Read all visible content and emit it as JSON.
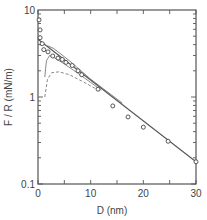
{
  "chart_data": {
    "type": "scatter",
    "title": "",
    "xlabel": "D  (nm)",
    "ylabel": "F / R  (mN/m)",
    "xlim": [
      0,
      30
    ],
    "ylim": [
      0.1,
      10
    ],
    "yscale": "log",
    "grid": false,
    "x_ticks": [
      0,
      10,
      20,
      30
    ],
    "x_tick_labels": [
      "0",
      "10",
      "20",
      "30"
    ],
    "x_minor_ticks": [
      5,
      15,
      25
    ],
    "y_tick_labels": [
      "0.1",
      "1",
      "10"
    ],
    "y_ticks": [
      0.1,
      1,
      10
    ],
    "series": [
      {
        "name": "measured",
        "style": "open-circles",
        "x": [
          0.2,
          0.4,
          0.4,
          0.8,
          1.1,
          1.9,
          2.8,
          3.8,
          4.6,
          5.3,
          6.5,
          7.6,
          8.3,
          11.4,
          14.2,
          17.1,
          20.0,
          24.7,
          30.0
        ],
        "y": [
          7.7,
          5.9,
          4.8,
          4.1,
          3.5,
          3.3,
          2.96,
          2.8,
          2.7,
          2.5,
          2.3,
          2.0,
          1.8,
          1.23,
          0.79,
          0.59,
          0.45,
          0.31,
          0.18
        ]
      },
      {
        "name": "fit-solid",
        "style": "solid-line",
        "x": [
          0,
          30
        ],
        "y": [
          4.6,
          0.18
        ]
      },
      {
        "name": "theory-upper",
        "style": "thin-line",
        "x": [
          1.8,
          3,
          6,
          10,
          16
        ],
        "y": [
          3.9,
          3.6,
          2.6,
          1.6,
          0.85
        ]
      },
      {
        "name": "theory-middle",
        "style": "thin-curve",
        "x": [
          1.3,
          1.6,
          2.2,
          3.2,
          5,
          8,
          12
        ],
        "y": [
          1.7,
          2.6,
          3.0,
          2.8,
          2.4,
          1.8,
          1.2
        ]
      },
      {
        "name": "theory-dashed",
        "style": "dashed-curve",
        "x": [
          1.3,
          1.8,
          2.6,
          4,
          6,
          9,
          12
        ],
        "y": [
          1.0,
          1.6,
          1.9,
          1.95,
          1.8,
          1.45,
          1.15
        ]
      }
    ]
  },
  "axes": {
    "x_title": "D  (nm)",
    "y_title": "F / R  (mN/m)"
  }
}
